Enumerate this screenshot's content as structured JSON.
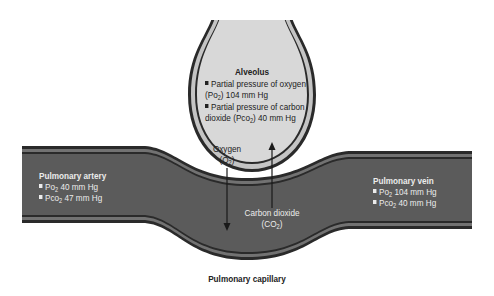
{
  "alveolus": {
    "title": "Alveolus",
    "items": [
      {
        "line1": "Partial pressure of oxygen",
        "line2_pre": "(Po",
        "sub": "2",
        "line2_post": ") 104 mm Hg"
      },
      {
        "line1": "Partial pressure of carbon",
        "line2_pre": "dioxide (Pco",
        "sub": "2",
        "line2_post": ") 40 mm Hg"
      }
    ]
  },
  "pulmonary_artery": {
    "title": "Pulmonary artery",
    "items": [
      {
        "pre": "Po",
        "sub": "2",
        "post": " 40 mm Hg"
      },
      {
        "pre": "Pco",
        "sub": "2",
        "post": " 47 mm Hg"
      }
    ]
  },
  "pulmonary_vein": {
    "title": "Pulmonary vein",
    "items": [
      {
        "pre": "Po",
        "sub": "2",
        "post": " 104 mm Hg"
      },
      {
        "pre": "Pco",
        "sub": "2",
        "post": " 40 mm Hg"
      }
    ]
  },
  "oxygen_arrow": {
    "label": "Oxygen",
    "formula_pre": "(O",
    "formula_sub": "2",
    "formula_post": ")",
    "direction": "down"
  },
  "co2_arrow": {
    "label": "Carbon dioxide",
    "formula_pre": "(CO",
    "formula_sub": "2",
    "formula_post": ")",
    "direction": "up"
  },
  "capillary_label": "Pulmonary capillary",
  "colors": {
    "vessel_fill": "#5b5b5b",
    "vessel_wall": "#2a2a2a",
    "vessel_stripe": "#707070",
    "alveolus_fill": "#d6d6d6",
    "alveolus_wall_light": "#c2c2c2",
    "alveolus_wall_dark": "#2a2a2a",
    "text_dark": "#222222",
    "text_light": "#ececec"
  }
}
